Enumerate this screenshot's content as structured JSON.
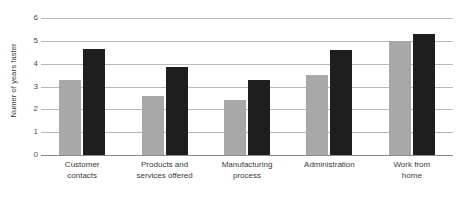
{
  "chart_data": {
    "type": "bar",
    "title": "",
    "subtitle": "",
    "xlabel": "",
    "ylabel": "Numer of years faster",
    "ylim": [
      0,
      6
    ],
    "yticks": [
      0,
      1,
      2,
      3,
      4,
      5,
      6
    ],
    "ytick_labels": [
      "0",
      "1",
      "2",
      "3",
      "4",
      "5",
      "6"
    ],
    "grid": true,
    "legend": null,
    "legend_position": "none",
    "categories": [
      "Customer contacts",
      "Products and services offered",
      "Manufacturing process",
      "Administration",
      "Work from home"
    ],
    "category_lines": [
      [
        "Customer",
        "contacts"
      ],
      [
        "Products and",
        "services offered"
      ],
      [
        "Manufacturing",
        "process"
      ],
      [
        "Administration"
      ],
      [
        "Work from",
        "home"
      ]
    ],
    "series": [
      {
        "name": "series-light",
        "color": "#a8a8a8",
        "values": [
          3.3,
          2.6,
          2.4,
          3.5,
          5.0
        ]
      },
      {
        "name": "series-dark",
        "color": "#1e1e1e",
        "values": [
          4.65,
          3.85,
          3.3,
          4.6,
          5.3
        ]
      }
    ],
    "colors": {
      "series_light": "#a8a8a8",
      "series_dark": "#1e1e1e",
      "gridline": "#b9b9b9",
      "axis": "#8a8a8a",
      "text": "#3a3a3a",
      "background": "#ffffff"
    }
  }
}
